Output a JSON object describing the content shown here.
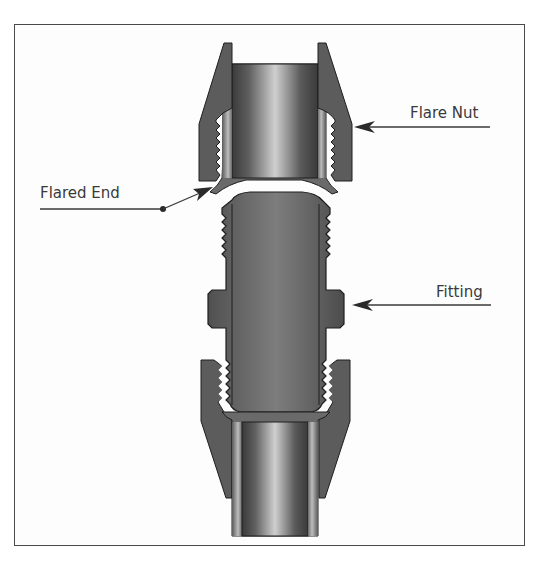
{
  "diagram": {
    "labels": {
      "flare_nut": "Flare Nut",
      "flared_end": "Flared End",
      "fitting": "Fitting"
    },
    "colors": {
      "frame_border": "#4a4a4a",
      "metal_dark": "#4f4f4f",
      "metal_mid": "#6e6e6e",
      "metal_light": "#c8c8c8",
      "outline": "#1e1e1e",
      "label_text": "#3a3a3a"
    }
  }
}
